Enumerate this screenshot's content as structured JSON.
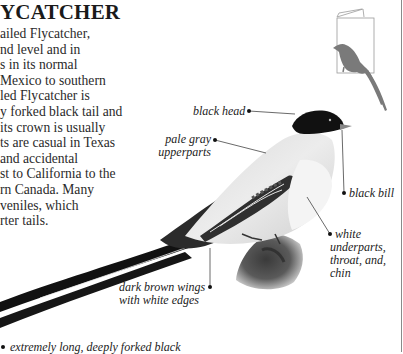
{
  "header": {
    "title": "YCATCHER"
  },
  "body": {
    "lines": [
      "ailed Flycatcher,",
      "nd level and in",
      "s in its normal",
      "Mexico to southern",
      "led Flycatcher is",
      "y forked black tail and",
      "its crown is usually",
      "ts are casual in Texas",
      "and accidental",
      "st to California to the",
      "rn Canada. Many",
      "veniles, which",
      "rter tails."
    ]
  },
  "illustration": {
    "subject": "Fork-tailed Flycatcher perched on rock",
    "thumbnail": "book-with-bird-silhouette-icon",
    "labels": {
      "black_head": "black head",
      "pale_gray_1": "pale gray",
      "pale_gray_2": "upperparts",
      "black_bill": "black bill",
      "white_1": "white",
      "white_2": "underparts,",
      "white_3": "throat, and,",
      "white_4": "chin",
      "wings_1": "dark brown wings",
      "wings_2": "with white edges",
      "tail": "extremely long, deeply forked black"
    }
  },
  "colors": {
    "text": "#222222",
    "rule": "#8a8a8a",
    "thumbnail_bird": "#7a7a7a",
    "leader_line": "#444444"
  }
}
